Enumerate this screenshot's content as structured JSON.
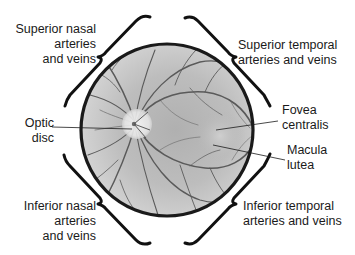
{
  "diagram": {
    "labels": {
      "superior_nasal": [
        "Superior nasal",
        "arteries",
        "and veins"
      ],
      "superior_temporal": [
        "Superior temporal",
        "arteries and veins"
      ],
      "optic_disc": [
        "Optic",
        "disc"
      ],
      "fovea_centralis": [
        "Fovea",
        "centralis"
      ],
      "macula_lutea": [
        "Macula",
        "lutea"
      ],
      "inferior_nasal": [
        "Inferior nasal",
        "arteries",
        "and veins"
      ],
      "inferior_temporal": [
        "Inferior temporal",
        "arteries and veins"
      ]
    },
    "colors": {
      "outline": "#1a1a1a",
      "retina_base": "#b8b8b8",
      "retina_light": "#dcdcdc",
      "vessel": "#555555",
      "optic_disc": "#eeeeee"
    }
  }
}
